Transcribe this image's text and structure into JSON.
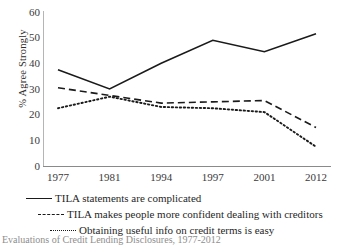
{
  "chart_data": {
    "type": "line",
    "title": "",
    "xlabel": "",
    "ylabel": "% Agree Strongly",
    "categories": [
      "1977",
      "1981",
      "1994",
      "1997",
      "2001",
      "2012"
    ],
    "ylim": [
      0,
      60
    ],
    "yticks": [
      0,
      10,
      20,
      30,
      40,
      50,
      60
    ],
    "grid": false,
    "legend_position": "bottom",
    "series": [
      {
        "name": "TILA statements are complicated",
        "style": "solid",
        "color": "#1a1a1a",
        "values": [
          37.5,
          30,
          40,
          49,
          44.5,
          51.5
        ]
      },
      {
        "name": "TILA makes people more confident dealing with creditors",
        "style": "dashed",
        "color": "#1a1a1a",
        "values": [
          30.5,
          27.5,
          24.5,
          25,
          25.5,
          15
        ]
      },
      {
        "name": "Obtaining useful info on credit terms is easy",
        "style": "dotted",
        "color": "#1a1a1a",
        "values": [
          22.5,
          27,
          23,
          22.5,
          21,
          7.5
        ]
      }
    ]
  },
  "caption": {
    "text": "Evaluations of Credit Lending Disclosures, 1977-2012"
  }
}
